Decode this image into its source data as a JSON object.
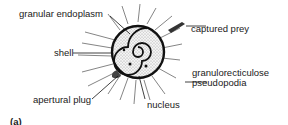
{
  "figure": {
    "panel_label": "(a)"
  },
  "labels": {
    "granular_endoplasm": "granular endoplasm",
    "shell": "shell",
    "captured_prey": "captured prey",
    "granuloreticulose_line1": "granulorecticulose",
    "granuloreticulose_line2": "pseudopodia",
    "apertural_plug": "apertural plug",
    "nucleus": "nucleus"
  }
}
